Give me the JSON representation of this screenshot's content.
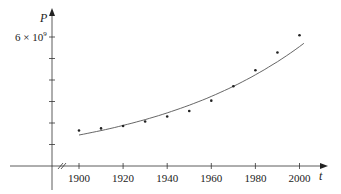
{
  "chart_data": {
    "type": "scatter",
    "title": "",
    "xlabel": "t",
    "ylabel": "P",
    "x_ticks": [
      "1900",
      "1920",
      "1940",
      "1960",
      "1980",
      "2000"
    ],
    "y_tick_label": "6 × 10⁹",
    "y_tick_count": 6,
    "ylim": [
      0,
      6500000000
    ],
    "xlim": [
      1888,
      2010
    ],
    "grid": false,
    "legend": "none",
    "series": [
      {
        "name": "population data",
        "kind": "points",
        "x": [
          1900,
          1910,
          1920,
          1930,
          1940,
          1950,
          1960,
          1970,
          1980,
          1990,
          2000
        ],
        "y": [
          1650000000.0,
          1750000000.0,
          1860000000.0,
          2070000000.0,
          2300000000.0,
          2560000000.0,
          3040000000.0,
          3710000000.0,
          4450000000.0,
          5280000000.0,
          6080000000.0
        ]
      },
      {
        "name": "exponential model",
        "kind": "curve",
        "x": [
          1900,
          1920,
          1940,
          1960,
          1980,
          2000,
          2003
        ],
        "y": [
          1440000000.0,
          1770000000.0,
          2180000000.0,
          2680000000.0,
          3650000000.0,
          5400000000.0,
          5950000000.0
        ]
      }
    ]
  },
  "labels": {
    "y_axis": "P",
    "x_axis": "t",
    "y_tick_main": "6 × 10",
    "y_tick_exp": "9"
  }
}
